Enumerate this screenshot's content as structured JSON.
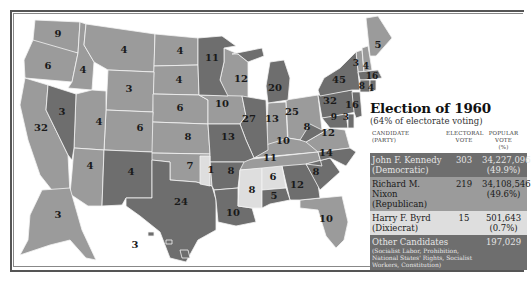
{
  "legend": {
    "title": "Election of 1960",
    "subtitle": "(64% of electorate voting)",
    "headers": {
      "candidate": "CANDIDATE",
      "candidate_sub": "(PARTY)",
      "electoral": "ELECTORAL",
      "electoral_sub": "VOTE",
      "popular": "POPULAR VOTE",
      "popular_sub": "(%)"
    },
    "rows": [
      {
        "name": "John F. Kennedy",
        "party": "(Democratic)",
        "electoral": "303",
        "popular": "34,227,096",
        "percent": "(49.9%)",
        "color": "#6e6e6e"
      },
      {
        "name": "Richard M. Nixon",
        "party": "(Republican)",
        "electoral": "219",
        "popular": "34,108,546",
        "percent": "(49.6%)",
        "color": "#9b9b9b"
      },
      {
        "name": "Harry F. Byrd",
        "party": "(Dixiecrat)",
        "electoral": "15",
        "popular": "501,643",
        "percent": "(0.7%)",
        "color": "#dedede"
      },
      {
        "name": "Other Candidates",
        "party": "(Socialist Labor, Prohibition, National States' Rights, Socialist Workers, Constitution)",
        "electoral": "",
        "popular": "197,029",
        "percent": "",
        "color": "#6e6e6e"
      }
    ]
  },
  "colors": {
    "democratic": "#6e6e6e",
    "republican": "#9b9b9b",
    "dixiecrat": "#dedede",
    "border": "#f4f4f4"
  },
  "states": {
    "WA": "9",
    "OR": "6",
    "ID": "4",
    "MT": "4",
    "ND": "4",
    "MN": "11",
    "WI": "12",
    "MI": "20",
    "NY": "45",
    "VT": "3",
    "NH": "4",
    "ME": "5",
    "MA": "16",
    "RI": "4",
    "CT": "8",
    "NJ": "16",
    "PA": "32",
    "DE": "3",
    "MD": "9",
    "WV": "8",
    "VA": "12",
    "NC": "14",
    "SC": "8",
    "GA": "12",
    "FL": "10",
    "AL": "5",
    "AL_byrd": "6",
    "MS": "8",
    "TN": "11",
    "KY": "10",
    "OH": "25",
    "IN": "13",
    "IL": "27",
    "IA": "10",
    "MO": "13",
    "AR": "8",
    "LA": "10",
    "TX": "24",
    "OK": "7",
    "OK_byrd": "1",
    "KS": "8",
    "NE": "6",
    "SD": "4",
    "WY": "3",
    "CO": "6",
    "UT": "4",
    "NV": "3",
    "CA": "32",
    "AZ": "4",
    "NM": "4",
    "AK": "3",
    "HI": "3"
  }
}
